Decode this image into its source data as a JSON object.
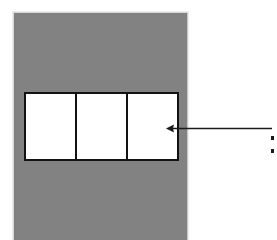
{
  "figure": {
    "background_color": "#ffffff"
  },
  "panel": {
    "name": "gray-background-panel",
    "fill_color": "#828282",
    "border_color": "#d8d8d8",
    "label": ""
  },
  "boxes": {
    "name": "three-box-row",
    "count": 3,
    "fill_color": "#ffffff",
    "border_color": "#121212",
    "items": [
      {
        "label": ""
      },
      {
        "label": ""
      },
      {
        "label": ""
      }
    ]
  },
  "annotation": {
    "name": "leader-arrow",
    "direction": "left",
    "color": "#1a1a1a",
    "target": "third-box",
    "label": ""
  },
  "callout": {
    "name": "cut-off-bullet-list",
    "color": "#1a1a1a",
    "items": [
      {
        "marker": ""
      },
      {
        "marker": ""
      }
    ]
  }
}
